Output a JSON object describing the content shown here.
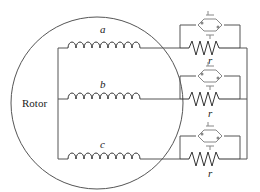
{
  "diagram": {
    "rotor_label": "Rotor",
    "phases": [
      {
        "winding_label": "a",
        "resistor_label": "r"
      },
      {
        "winding_label": "b",
        "resistor_label": "r"
      },
      {
        "winding_label": "c",
        "resistor_label": "r"
      }
    ],
    "colors": {
      "line": "#555555",
      "coil": "#333333",
      "switch": "#888888",
      "background": "#ffffff"
    }
  }
}
